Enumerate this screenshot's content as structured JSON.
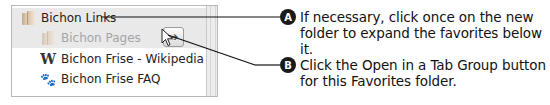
{
  "favorites_panel": {
    "items": [
      {
        "label": "Bichon Links",
        "icon": "folder-icon",
        "level": 0,
        "highlighted": true
      },
      {
        "label": "Bichon Pages",
        "icon": "folder-icon",
        "level": 1,
        "highlighted": true,
        "dimmed": true
      },
      {
        "label": "Bichon Frise - Wikipedia",
        "icon": "wikipedia-icon",
        "glyph": "W",
        "level": 1
      },
      {
        "label": "Bichon Frise FAQ",
        "icon": "paw-icon",
        "glyph": "🐾",
        "level": 1
      }
    ],
    "open_tab_group_button": {
      "glyph": "➔",
      "icon": "arrow-right-icon"
    }
  },
  "callouts": [
    {
      "badge": "A",
      "text_line1": "If necessary, click once on the new",
      "text_line2": "folder to expand the favorites below it."
    },
    {
      "badge": "B",
      "text_line1": "Click the Open in a Tab Group button",
      "text_line2": "for this Favorites folder."
    }
  ]
}
